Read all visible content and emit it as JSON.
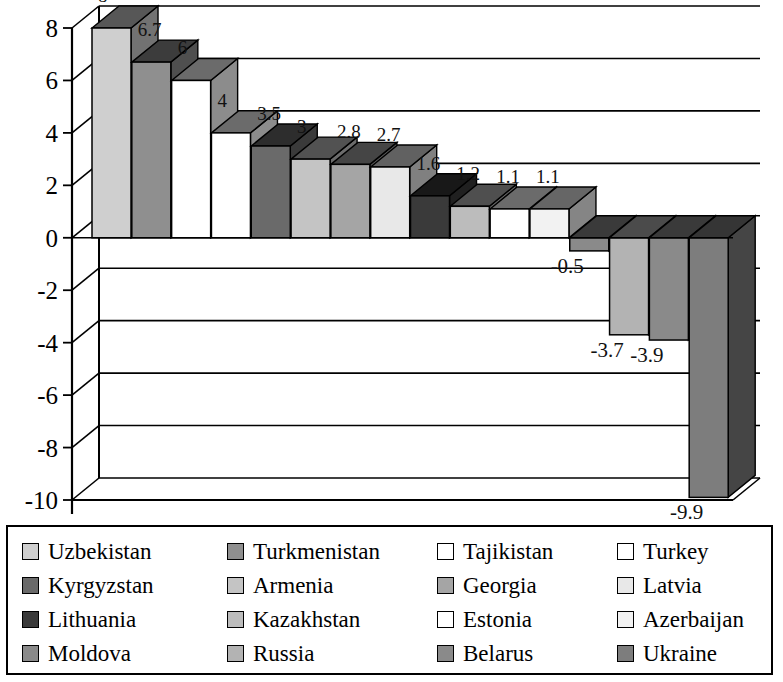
{
  "chart_data": {
    "type": "bar",
    "title": "",
    "xlabel": "",
    "ylabel": "",
    "ylim": [
      -10,
      8
    ],
    "grid": true,
    "legend_position": "bottom",
    "categories": [
      "Uzbekistan",
      "Turkmenistan",
      "Tajikistan",
      "Turkey",
      "Kyrgyzstan",
      "Armenia",
      "Georgia",
      "Latvia",
      "Lithuania",
      "Kazakhstan",
      "Estonia",
      "Azerbaijan",
      "Moldova",
      "Russia",
      "Belarus",
      "Ukraine"
    ],
    "values": [
      8,
      6.7,
      6,
      4,
      3.5,
      3,
      2.8,
      2.7,
      1.6,
      1.2,
      1.1,
      1.1,
      -0.5,
      -3.7,
      -3.9,
      -9.9
    ],
    "value_labels": [
      "8",
      "6.7",
      "6",
      "4",
      "3.5",
      "3",
      "2.8",
      "2.7",
      "1.6",
      "1.2",
      "1.1",
      "1.1",
      "-0.5",
      "-3.7",
      "-3.9",
      "-9.9"
    ],
    "colors": [
      "#cfcfcf",
      "#8f8f8f",
      "#ffffff",
      "#ffffff",
      "#6a6a6a",
      "#c4c4c4",
      "#a5a5a5",
      "#e8e8e8",
      "#3a3a3a",
      "#bcbcbc",
      "#ffffff",
      "#f2f2f2",
      "#8a8a8a",
      "#b3b3b3",
      "#8a8a8a",
      "#7d7d7d"
    ],
    "y_ticks": [
      8,
      6,
      4,
      2,
      0,
      -2,
      -4,
      -6,
      -8,
      -10
    ],
    "y_tick_labels": [
      "8",
      "6",
      "4",
      "2",
      "0",
      "-2",
      "-4",
      "-6",
      "-8",
      "-10"
    ]
  },
  "legend": {
    "items": [
      {
        "label": "Uzbekistan",
        "color": "#cfcfcf"
      },
      {
        "label": "Turkmenistan",
        "color": "#8f8f8f"
      },
      {
        "label": "Tajikistan",
        "color": "#ffffff"
      },
      {
        "label": "Turkey",
        "color": "#ffffff"
      },
      {
        "label": "Kyrgyzstan",
        "color": "#6a6a6a"
      },
      {
        "label": "Armenia",
        "color": "#c4c4c4"
      },
      {
        "label": "Georgia",
        "color": "#a5a5a5"
      },
      {
        "label": "Latvia",
        "color": "#e8e8e8"
      },
      {
        "label": "Lithuania",
        "color": "#3a3a3a"
      },
      {
        "label": "Kazakhstan",
        "color": "#bcbcbc"
      },
      {
        "label": "Estonia",
        "color": "#ffffff"
      },
      {
        "label": "Azerbaijan",
        "color": "#f2f2f2"
      },
      {
        "label": "Moldova",
        "color": "#8a8a8a"
      },
      {
        "label": "Russia",
        "color": "#b3b3b3"
      },
      {
        "label": "Belarus",
        "color": "#8a8a8a"
      },
      {
        "label": "Ukraine",
        "color": "#7d7d7d"
      }
    ]
  }
}
